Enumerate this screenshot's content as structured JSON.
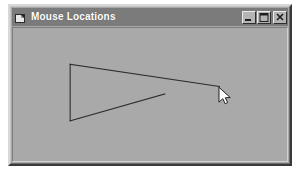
{
  "window": {
    "title": "Mouse Locations",
    "icon": "application-icon",
    "titlebar_color": "#7b7b7b",
    "face_color": "#a8a8a8",
    "client_color": "#a9a9a9",
    "buttons": [
      {
        "name": "minimize-button",
        "label": "Minimize",
        "glyph": "minimize"
      },
      {
        "name": "maximize-button",
        "label": "Maximize",
        "glyph": "maximize"
      },
      {
        "name": "close-button",
        "label": "Close",
        "glyph": "close"
      }
    ]
  },
  "canvas": {
    "name": "mouse-trail-canvas",
    "stroke_color": "#2b2b2b",
    "background_color": "#a9a9a9",
    "polyline_points": "58,38 209,61 210,63 151,69 58,97 58,38",
    "paths": [
      {
        "name": "top-edge",
        "points": "58,38 209,61"
      },
      {
        "name": "hook-at-cursor",
        "points": "209,61 210,64"
      },
      {
        "name": "diagonal-edge",
        "points": "154,69 58,97"
      },
      {
        "name": "left-edge",
        "points": "58,38 58,97"
      }
    ]
  },
  "cursor": {
    "name": "mouse-pointer",
    "type": "arrow",
    "x": 209,
    "y": 62,
    "fill": "#ffffff",
    "outline": "#1a1a1a"
  }
}
